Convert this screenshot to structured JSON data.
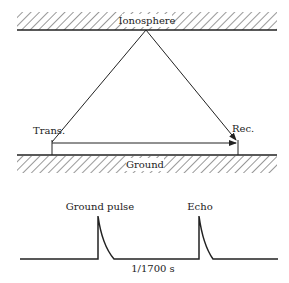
{
  "diagram": {
    "ionosphere_label": "Ionosphere",
    "ground_label": "Ground",
    "transmitter_label": "Trans.",
    "receiver_label": "Rec.",
    "ground_pulse_label": "Ground pulse",
    "echo_label": "Echo",
    "time_interval_label": "1/1700 s"
  },
  "colors": {
    "line": "#222222",
    "background": "#ffffff"
  }
}
